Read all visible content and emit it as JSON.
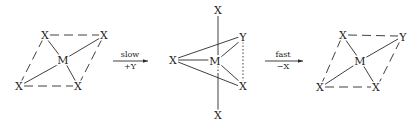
{
  "figure": {
    "type": "reaction-scheme"
  },
  "reactant": {
    "center": "M",
    "ligands": [
      "X",
      "X",
      "X",
      "X"
    ]
  },
  "step1": {
    "label_above": "slow",
    "label_below": "+Y"
  },
  "intermediate": {
    "center": "M",
    "axial": [
      "X",
      "X"
    ],
    "equatorial": [
      "X",
      "Y",
      "X"
    ]
  },
  "step2": {
    "label_above": "fast",
    "label_below": "−X"
  },
  "product": {
    "center": "M",
    "ligands": [
      "X",
      "Y",
      "X",
      "X"
    ]
  }
}
